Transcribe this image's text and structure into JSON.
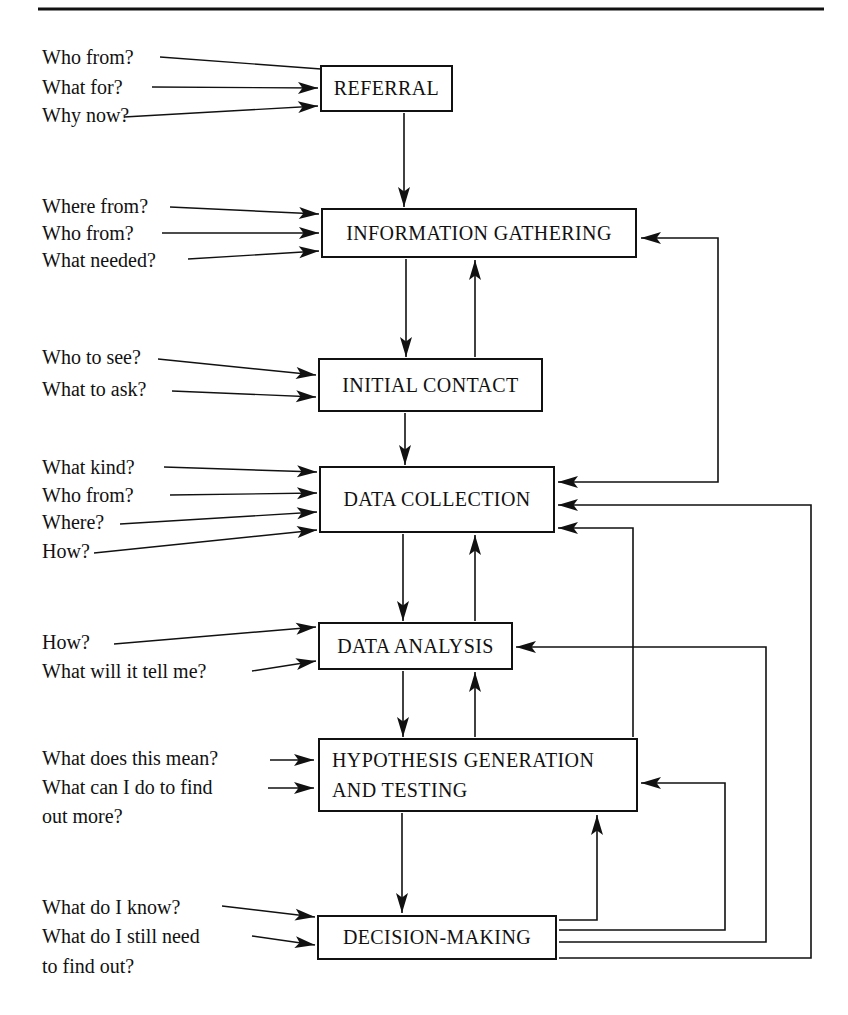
{
  "figure": {
    "stages": {
      "referral": {
        "label": "REFERRAL",
        "questions": {
          "q1": "Who from?",
          "q2": "What for?",
          "q3": "Why now?"
        }
      },
      "information_gathering": {
        "label": "INFORMATION GATHERING",
        "questions": {
          "q1": "Where from?",
          "q2": "Who from?",
          "q3": "What needed?"
        }
      },
      "initial_contact": {
        "label": "INITIAL CONTACT",
        "questions": {
          "q1": "Who to see?",
          "q2": "What to ask?"
        }
      },
      "data_collection": {
        "label": "DATA COLLECTION",
        "questions": {
          "q1": "What kind?",
          "q2": "Who from?",
          "q3": "Where?",
          "q4": "How?"
        }
      },
      "data_analysis": {
        "label": "DATA ANALYSIS",
        "questions": {
          "q1": "How?",
          "q2": "What will it tell me?"
        }
      },
      "hypothesis_generation": {
        "label_line1": "HYPOTHESIS GENERATION",
        "label_line2": "AND TESTING",
        "questions": {
          "q1": "What does this mean?",
          "q2_line1": "What can I do to find",
          "q2_line2": "out more?"
        }
      },
      "decision_making": {
        "label": "DECISION-MAKING",
        "questions": {
          "q1": "What do I know?",
          "q2_line1": "What do I still need",
          "q2_line2": "to find out?"
        }
      }
    },
    "line_color": "#111111"
  }
}
